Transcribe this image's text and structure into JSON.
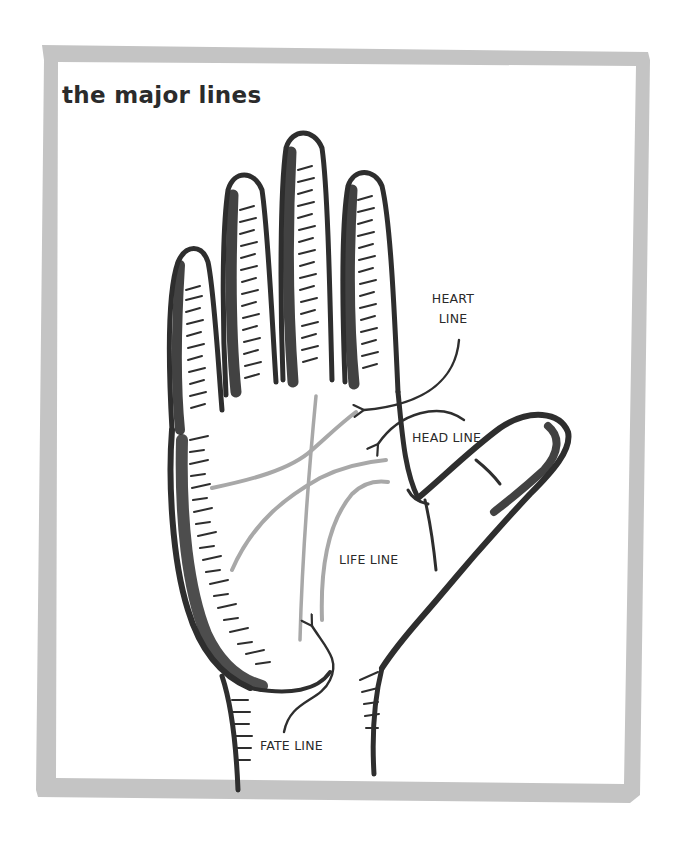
{
  "figure": {
    "title": "the major lines",
    "frame_color": "#c2c2c2",
    "ink_color": "#2e2e2e",
    "palm_line_color": "#a8a8a8"
  },
  "labels": {
    "heart_line": "HEART LINE",
    "heart_line_parts": [
      "HEART",
      "LINE"
    ],
    "head_line": "HEAD LINE",
    "life_line": "LIFE LINE",
    "fate_line": "FATE LINE"
  },
  "lines": [
    {
      "name": "heart line",
      "label": "HEART LINE"
    },
    {
      "name": "head line",
      "label": "HEAD LINE"
    },
    {
      "name": "life line",
      "label": "LIFE LINE"
    },
    {
      "name": "fate line",
      "label": "FATE LINE"
    }
  ]
}
